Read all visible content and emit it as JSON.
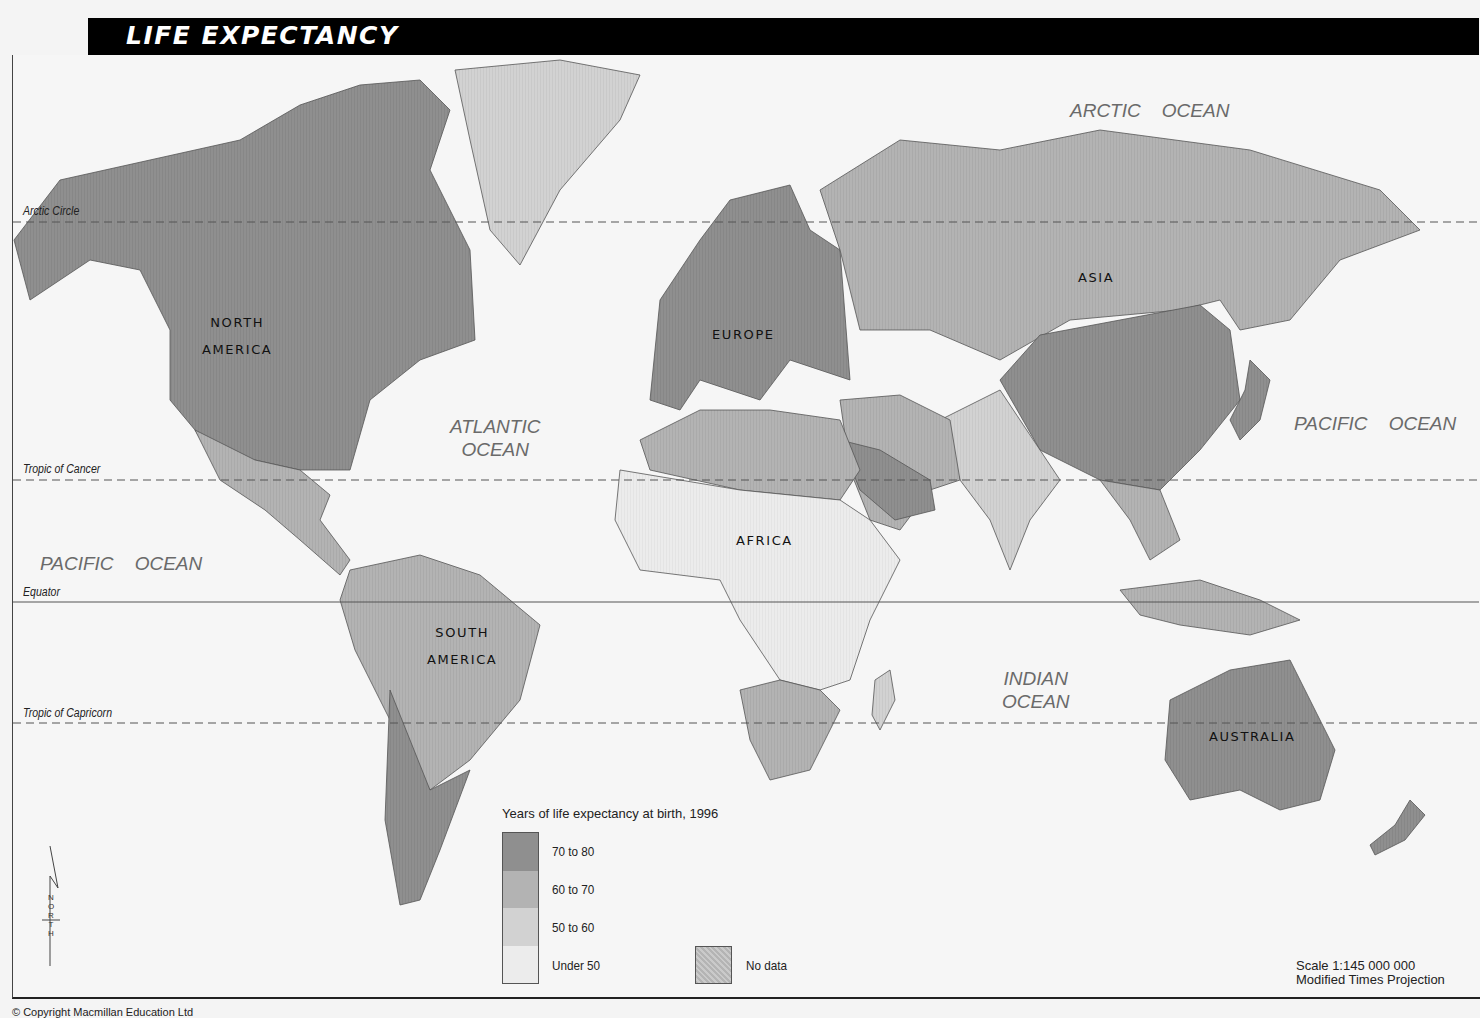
{
  "title": "LIFE EXPECTANCY",
  "reference_lines": [
    {
      "label": "Arctic Circle",
      "y": 222,
      "style": "dashed"
    },
    {
      "label": "Tropic of Cancer",
      "y": 480,
      "style": "dashed"
    },
    {
      "label": "Equator",
      "y": 602,
      "style": "solid"
    },
    {
      "label": "Tropic of Capricorn",
      "y": 723,
      "style": "dashed"
    }
  ],
  "oceans": [
    {
      "label": "ARCTIC    OCEAN"
    },
    {
      "label": "PACIFIC    OCEAN"
    },
    {
      "label": "ATLANTIC\nOCEAN"
    },
    {
      "label": "PACIFIC    OCEAN"
    },
    {
      "label": "INDIAN\nOCEAN"
    }
  ],
  "continents": [
    {
      "label": "NORTH\nAMERICA"
    },
    {
      "label": "EUROPE"
    },
    {
      "label": "ASIA"
    },
    {
      "label": "AFRICA"
    },
    {
      "label": "SOUTH\nAMERICA"
    },
    {
      "label": "AUSTRALIA"
    }
  ],
  "legend": {
    "title": "Years of life expectancy at birth, 1996",
    "categories": [
      {
        "label": "70 to 80",
        "color": "#8f8f8f"
      },
      {
        "label": "60 to 70",
        "color": "#b3b3b3"
      },
      {
        "label": "50 to 60",
        "color": "#d2d2d2"
      },
      {
        "label": "Under 50",
        "color": "#ececec"
      }
    ],
    "no_data": {
      "label": "No data",
      "color": "#bdbdbd"
    }
  },
  "scale": {
    "line1": "Scale 1:145 000 000",
    "line2": "Modified Times Projection"
  },
  "north_arrow": {
    "letters": "N\nO\nR\nT\nH"
  },
  "copyright": "© Copyright Macmillan Education Ltd",
  "colors": {
    "background": "#f6f6f6",
    "land_70_80": "#8f8f8f",
    "land_60_70": "#b3b3b3",
    "land_50_60": "#d2d2d2",
    "land_under_50": "#ececec",
    "title_bar": "#000000"
  },
  "regions": {
    "north_america": "70 to 80",
    "greenland": "50 to 60",
    "mexico_central_america": "60 to 70",
    "south_america_north": "60 to 70",
    "argentina_chile": "70 to 80",
    "europe": "70 to 80",
    "russia_central_asia": "60 to 70",
    "china": "70 to 80",
    "south_asia": "50 to 60",
    "middle_east": "60 to 70",
    "north_africa": "60 to 70",
    "sub_saharan_africa": "Under 50",
    "southern_africa": "60 to 70",
    "southeast_asia": "60 to 70",
    "japan": "70 to 80",
    "australia_nz": "70 to 80"
  }
}
